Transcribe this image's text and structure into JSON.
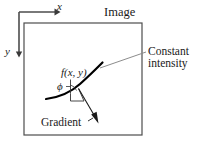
{
  "figure": {
    "title_label": "Image",
    "annotations": {
      "constant_intensity": "Constant\nintensity",
      "gradient": "Gradient",
      "function": "f(x, y)",
      "angle": "ϕ"
    },
    "axes": {
      "x_label": "x",
      "y_label": "y",
      "origin": [
        19,
        12
      ],
      "x_arrow_end": [
        56,
        12
      ],
      "y_arrow_end": [
        19,
        57
      ]
    },
    "image_frame": {
      "x": 24,
      "y": 23,
      "width": 118,
      "height": 112,
      "stroke": "#4d4d4d"
    },
    "colors": {
      "ink": "#1a1a1a",
      "frame": "#4d4d4d",
      "axis": "#4d4d4d",
      "leader": "#808080",
      "curve": "#000000"
    },
    "curve": {
      "description": "constant intensity contour",
      "points": [
        [
          46,
          99
        ],
        [
          60,
          96
        ],
        [
          72,
          90
        ],
        [
          84,
          80
        ],
        [
          96,
          69
        ],
        [
          102,
          63
        ]
      ],
      "stroke_width": 2.1
    },
    "gradient_vector": {
      "from": [
        78,
        89
      ],
      "to": [
        98,
        123
      ]
    },
    "normal_tick": {
      "from": [
        70,
        80
      ],
      "to": [
        78,
        105
      ]
    },
    "leader_line": {
      "from": [
        100,
        68
      ],
      "to": [
        146,
        52
      ]
    },
    "angle_marker": {
      "vertex": [
        78,
        89
      ],
      "radius": 8
    }
  }
}
